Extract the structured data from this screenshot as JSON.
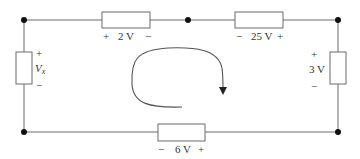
{
  "diagram": {
    "type": "circuit-kvl-loop",
    "colors": {
      "wire": "#6b6b6b",
      "node": "#111111",
      "text": "#333333"
    },
    "elements": [
      {
        "id": "top-left",
        "label": "2 V",
        "plus": "+",
        "minus": "−",
        "position": "top"
      },
      {
        "id": "top-right",
        "label": "25 V",
        "plus": "+",
        "minus": "−",
        "position": "top"
      },
      {
        "id": "left",
        "label_main": "V",
        "label_sub": "x",
        "plus": "+",
        "minus": "−",
        "position": "left"
      },
      {
        "id": "right",
        "label": "3 V",
        "plus": "+",
        "minus": "−",
        "position": "right"
      },
      {
        "id": "bottom",
        "label": "6 V",
        "plus": "+",
        "minus": "−",
        "position": "bottom"
      }
    ],
    "nodes": 5,
    "loop_direction": "clockwise"
  }
}
